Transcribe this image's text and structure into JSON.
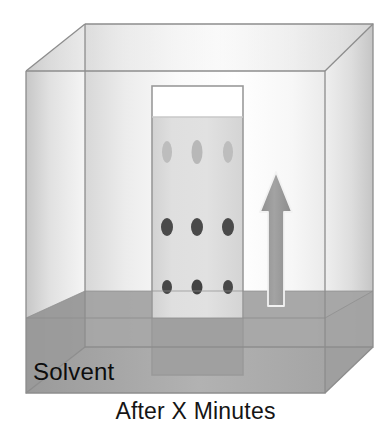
{
  "figure": {
    "title_caption": "After X Minutes",
    "solvent_label": "Solvent"
  },
  "chamber": {
    "name": "developing-chamber",
    "geometry": {
      "front_top_left": [
        26,
        71
      ],
      "front_top_right": [
        325,
        71
      ],
      "front_bottom_left": [
        26,
        393
      ],
      "front_bottom_right": [
        325,
        393
      ],
      "back_top_left": [
        85,
        24
      ],
      "back_top_right": [
        373,
        24
      ],
      "back_bottom_left": [
        85,
        347
      ],
      "back_bottom_right": [
        373,
        347
      ]
    },
    "colors": {
      "glass_light": "#fdfdfd",
      "glass_mid": "#e8e8e8",
      "glass_shade": "#d0d0d0",
      "edge_line": "#8d8d8d",
      "back_wall": "#f2f2f2"
    }
  },
  "solvent": {
    "name": "solvent-pool",
    "level_y_front": 318,
    "level_y_back": 291,
    "bottom_y_front": 393,
    "bottom_y_back": 347,
    "color": "#9d9d9d",
    "color_back": "#a8a8a8",
    "label": "Solvent"
  },
  "plate": {
    "name": "tlc-plate",
    "left_x": 152,
    "right_x": 243,
    "top_y": 86,
    "bottom_y": 375,
    "dry_top_color": "#ffffff",
    "wet_color": "#dcdcdc",
    "wet_start_y": 117,
    "submerged_color": "#a2a2a2",
    "border_color": "#909090"
  },
  "spot_rows": [
    {
      "name": "solvent-front-row",
      "row_index": 0,
      "center_y": 152,
      "rx": 5,
      "ry": 11,
      "color": "#bdbdbd",
      "spots_x": [
        167,
        197,
        228
      ]
    },
    {
      "name": "middle-spot-row",
      "row_index": 1,
      "center_y": 227,
      "rx": 6,
      "ry": 9,
      "color": "#4a4a4a",
      "spots_x": [
        167,
        197,
        228
      ]
    },
    {
      "name": "baseline-spot-row",
      "row_index": 2,
      "center_y": 287,
      "rx": 5,
      "ry": 7,
      "color": "#474747",
      "spots_x": [
        167,
        197,
        228
      ]
    }
  ],
  "arrow": {
    "name": "solvent-flow-arrow",
    "direction": "up",
    "tip_y": 172,
    "tail_y": 306,
    "shaft_left_x": 268,
    "shaft_right_x": 284,
    "head_left_x": 260,
    "head_right_x": 292,
    "head_base_y": 212,
    "fill": "#9a9a9a",
    "stroke": "#f4f4f4"
  }
}
